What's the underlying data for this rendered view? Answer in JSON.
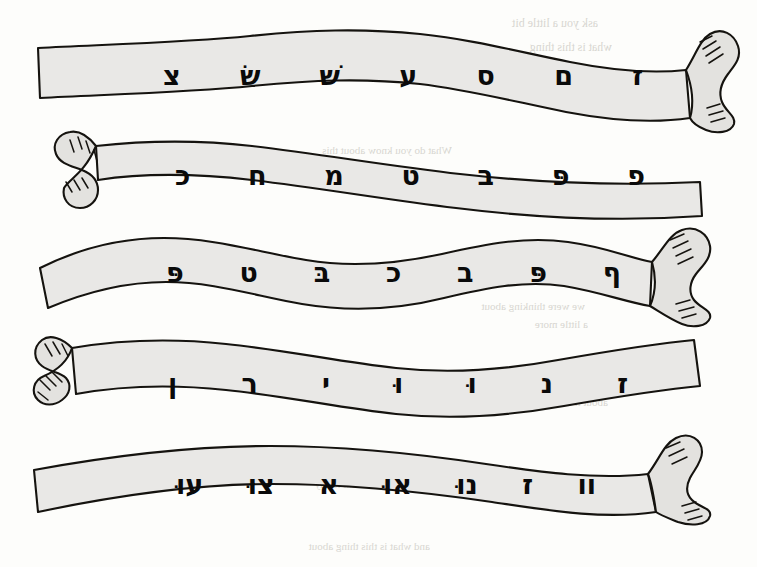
{
  "page": {
    "background_color": "#fdfdfb",
    "ribbon_fill_color": "#e9e8e6",
    "ribbon_stroke_color": "#15130f",
    "ink_color": "#0a0a0a",
    "bleedthrough_color": "#b9b6ae",
    "reading_direction": "right-to-left",
    "row_count": 5
  },
  "rows": [
    {
      "index": 1,
      "name": "scroll-row-1",
      "torn_edge_side": "right",
      "letters": [
        {
          "char": "ז",
          "name": "zayin"
        },
        {
          "char": "ם",
          "name": "final-mem"
        },
        {
          "char": "ס",
          "name": "samekh"
        },
        {
          "char": "ע",
          "name": "ayin"
        },
        {
          "char": "שׁ",
          "name": "shin"
        },
        {
          "char": "שׂ",
          "name": "sin"
        },
        {
          "char": "צ",
          "name": "tsadi"
        }
      ]
    },
    {
      "index": 2,
      "name": "scroll-row-2",
      "torn_edge_side": "left",
      "letters": [
        {
          "char": "פ",
          "name": "fe"
        },
        {
          "char": "פּ",
          "name": "pe-dagesh"
        },
        {
          "char": "ב",
          "name": "vet"
        },
        {
          "char": "ט",
          "name": "tet"
        },
        {
          "char": "מ",
          "name": "mem"
        },
        {
          "char": "ח",
          "name": "het"
        },
        {
          "char": "כ",
          "name": "kaf"
        }
      ]
    },
    {
      "index": 3,
      "name": "scroll-row-3",
      "torn_edge_side": "right",
      "letters": [
        {
          "char": "ף",
          "name": "final-fe"
        },
        {
          "char": "פּ",
          "name": "pe-dagesh"
        },
        {
          "char": "ב",
          "name": "vet"
        },
        {
          "char": "כ",
          "name": "kaf"
        },
        {
          "char": "בּ",
          "name": "bet-dagesh"
        },
        {
          "char": "ט",
          "name": "tet"
        },
        {
          "char": "פּ",
          "name": "pe-dagesh"
        }
      ]
    },
    {
      "index": 4,
      "name": "scroll-row-4",
      "torn_edge_side": "left",
      "letters": [
        {
          "char": "ז",
          "name": "zayin"
        },
        {
          "char": "נ",
          "name": "nun"
        },
        {
          "char": "וּ",
          "name": "vav-dagesh"
        },
        {
          "char": "וּ",
          "name": "vav-dagesh"
        },
        {
          "char": "י",
          "name": "yod"
        },
        {
          "char": "ר",
          "name": "resh"
        },
        {
          "char": "ן",
          "name": "final-nun"
        }
      ]
    },
    {
      "index": 5,
      "name": "scroll-row-5",
      "torn_edge_side": "right",
      "letters": [
        {
          "char": "וו",
          "name": "double-vav"
        },
        {
          "char": "ז",
          "name": "zayin"
        },
        {
          "char": "נוּ",
          "name": "nun-shuruk"
        },
        {
          "char": "אוּ",
          "name": "alef-shuruk"
        },
        {
          "char": "א",
          "name": "alef"
        },
        {
          "char": "צוּ",
          "name": "tsadi-shuruk"
        },
        {
          "char": "עוּ",
          "name": "ayin-shuruk"
        }
      ]
    }
  ],
  "bleedthrough": [
    {
      "text": "ask you a little bit",
      "x": 598,
      "y": 16,
      "size": 12
    },
    {
      "text": "what is this thing",
      "x": 612,
      "y": 40,
      "size": 12
    },
    {
      "text": "some of the ones",
      "x": 596,
      "y": 70,
      "size": 11
    },
    {
      "text": "What do you know about this",
      "x": 452,
      "y": 144,
      "size": 11
    },
    {
      "text": "we were thinking about",
      "x": 585,
      "y": 300,
      "size": 11
    },
    {
      "text": "a little more",
      "x": 588,
      "y": 318,
      "size": 11
    },
    {
      "text": "The thing we were thinking",
      "x": 600,
      "y": 378,
      "size": 11
    },
    {
      "text": "about it being",
      "x": 608,
      "y": 396,
      "size": 11
    },
    {
      "text": "What did God want to say",
      "x": 430,
      "y": 478,
      "size": 11
    },
    {
      "text": "and what is this thing about",
      "x": 430,
      "y": 540,
      "size": 11
    }
  ]
}
